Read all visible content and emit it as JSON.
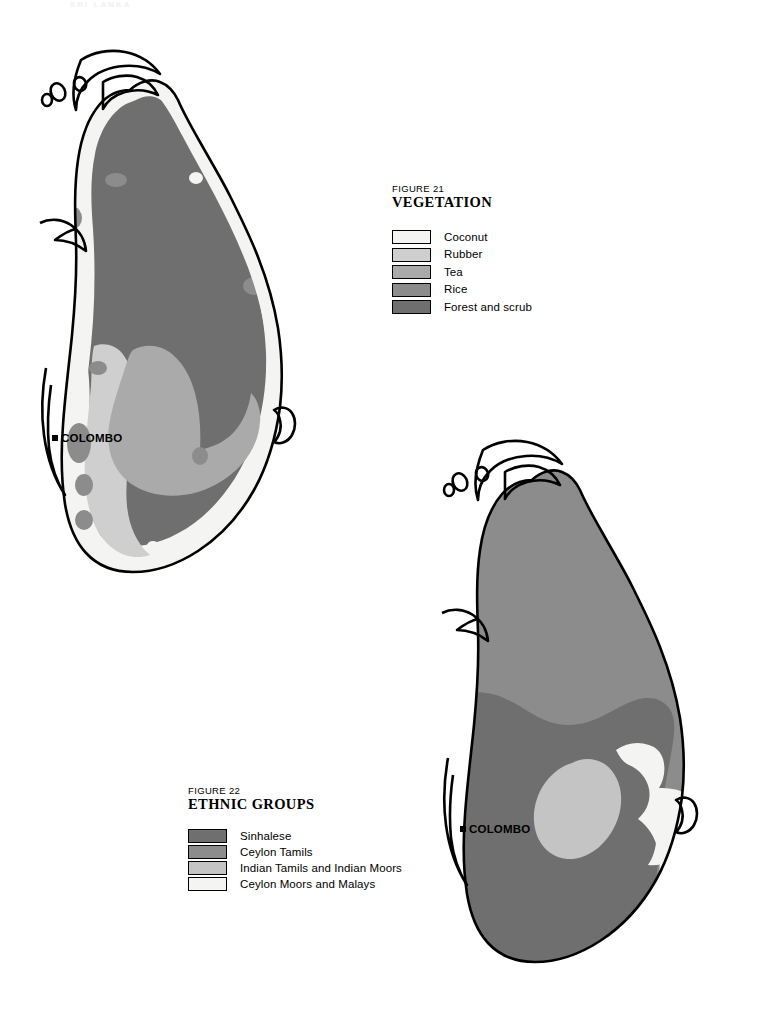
{
  "page": {
    "running_header": "SRI LANKA"
  },
  "colors": {
    "coconut": "#f4f4f2",
    "rubber": "#cfcfcf",
    "tea": "#aaaaaa",
    "rice": "#8c8c8c",
    "forest_scrub": "#6f6f6f",
    "sinhalese": "#6f6f6f",
    "ceylon_tamils": "#8c8c8c",
    "indian_tamils": "#c4c4c4",
    "ceylon_moors": "#f4f4f2",
    "outline": "#000000",
    "background": "#ffffff"
  },
  "maps": {
    "vegetation": {
      "name": "Sri Lanka vegetation map",
      "city_marker": "COLOMBO"
    },
    "ethnic": {
      "name": "Sri Lanka ethnic groups map",
      "city_marker": "COLOMBO"
    }
  },
  "legends": {
    "vegetation": {
      "figure_number": "FIGURE 21",
      "title": "VEGETATION",
      "items": [
        {
          "label": "Coconut",
          "color": "#f4f4f2"
        },
        {
          "label": "Rubber",
          "color": "#cfcfcf"
        },
        {
          "label": "Tea",
          "color": "#aaaaaa"
        },
        {
          "label": "Rice",
          "color": "#8c8c8c"
        },
        {
          "label": "Forest and scrub",
          "color": "#6f6f6f"
        }
      ]
    },
    "ethnic": {
      "figure_number": "FIGURE 22",
      "title": "ETHNIC GROUPS",
      "items": [
        {
          "label": "Sinhalese",
          "color": "#6f6f6f"
        },
        {
          "label": "Ceylon Tamils",
          "color": "#8c8c8c"
        },
        {
          "label": "Indian Tamils and Indian Moors",
          "color": "#c4c4c4"
        },
        {
          "label": "Ceylon Moors and Malays",
          "color": "#f4f4f2"
        }
      ]
    }
  }
}
